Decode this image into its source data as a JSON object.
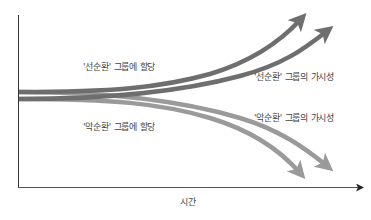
{
  "diagram": {
    "type": "diverging-trajectories",
    "axes": {
      "x_label": "시간",
      "y_label": ""
    },
    "labels": {
      "virtuous_assign": "'선순환' 그룹에 할당",
      "virtuous_visibility": "'선순환' 그룹의 가시성",
      "vicious_visibility": "'악순환' 그룹의 가시성",
      "vicious_assign": "'악순환' 그룹에 할당"
    },
    "colors": {
      "axis": "#333333",
      "upper_arrows": "#6e6e6e",
      "lower_arrows": "#9a9a9a",
      "text": "#444444"
    }
  }
}
